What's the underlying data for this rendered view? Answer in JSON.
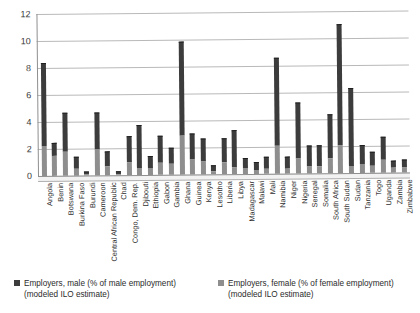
{
  "chart_data": {
    "type": "bar",
    "title": "",
    "xlabel": "",
    "ylabel": "",
    "ylim": [
      0,
      12
    ],
    "yticks": [
      0,
      2,
      4,
      6,
      8,
      10,
      12
    ],
    "grid": true,
    "stacked": true,
    "legend_position": "bottom",
    "categories": [
      "Angola",
      "Benin",
      "Botswana",
      "Burkina Faso",
      "Burundi",
      "Cameroon",
      "Central African Republic",
      "Chad",
      "Congo, Dem. Rep.",
      "Djibouti",
      "Ethiopia",
      "Gabon",
      "Gambia",
      "Ghana",
      "Guinea",
      "Kenya",
      "Lesotho",
      "Liberia",
      "Libya",
      "Madagascar",
      "Malawi",
      "Mali",
      "Namibia",
      "Niger",
      "Nigeria",
      "Senegal",
      "Somalia",
      "South Africa",
      "South Sudan",
      "Sudan",
      "Tanzania",
      "Togo",
      "Uganda",
      "Zambia",
      "Zimbabwe"
    ],
    "series": [
      {
        "name": "Employers, male (% of male employment) (modeled ILO estimate)",
        "color": "#3c3c3c",
        "values": [
          8.3,
          2.4,
          4.6,
          1.3,
          0.2,
          4.6,
          1.7,
          0.25,
          2.8,
          3.6,
          1.3,
          2.8,
          1.9,
          9.8,
          3.0,
          2.6,
          0.6,
          2.6,
          3.2,
          1.1,
          0.8,
          1.2,
          8.5,
          1.2,
          5.2,
          2.0,
          2.0,
          4.3,
          11.0,
          6.2,
          2.0,
          1.5,
          2.6,
          0.85,
          0.9
        ]
      },
      {
        "name": "Employers, female (% of female employment) (modeled ILO estimate)",
        "color": "#8e8e8e",
        "values": [
          2.2,
          1.5,
          1.8,
          0.55,
          0.08,
          1.9,
          0.7,
          0.1,
          1.0,
          0.55,
          0.5,
          0.9,
          0.8,
          2.9,
          1.1,
          0.95,
          0.2,
          0.9,
          0.5,
          0.45,
          0.3,
          0.4,
          2.1,
          0.4,
          1.1,
          0.55,
          0.5,
          1.1,
          2.1,
          0.5,
          0.7,
          0.5,
          0.95,
          0.35,
          0.35
        ]
      }
    ]
  },
  "legend": {
    "items": [
      {
        "line1": "Employers, male (% of male employment)",
        "line2": "(modeled ILO estimate)",
        "swatch": "male"
      },
      {
        "line1": "Employers, female (% of female employment)",
        "line2": "(modeled ILO estimate)",
        "swatch": "female"
      }
    ]
  }
}
